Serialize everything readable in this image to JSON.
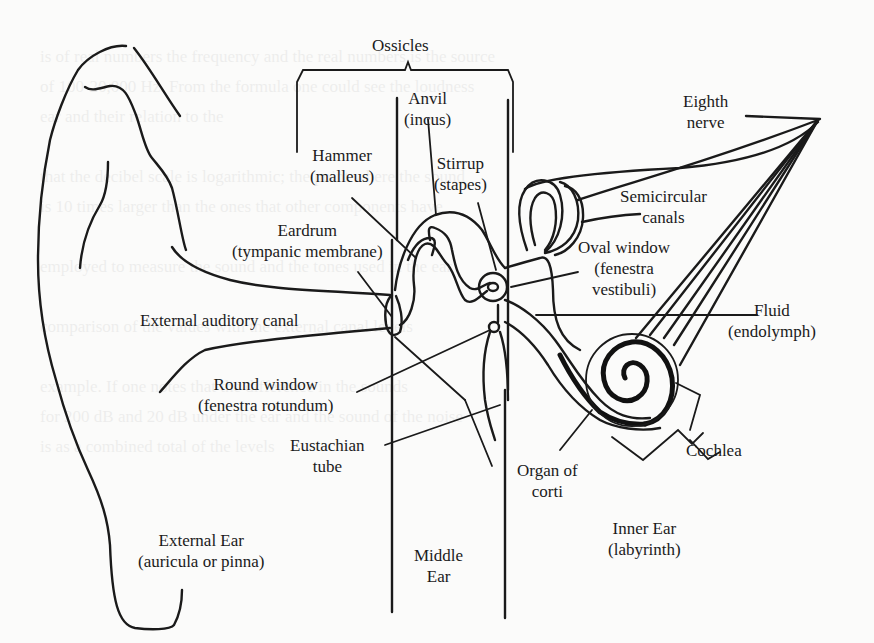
{
  "diagram": {
    "labels": {
      "ossicles": "Ossicles",
      "anvil": [
        "Anvil",
        "(incus)"
      ],
      "hammer": [
        "Hammer",
        "(malleus)"
      ],
      "stirrup": [
        "Stirrup",
        "(stapes)"
      ],
      "eighth_nerve": [
        "Eighth",
        "nerve"
      ],
      "semicircular_canals": [
        "Semicircular",
        "canals"
      ],
      "eardrum": [
        "Eardrum",
        "(tympanic membrane)"
      ],
      "oval_window": [
        "Oval window",
        "(fenestra",
        "vestibuli)"
      ],
      "fluid": [
        "Fluid",
        "(endolymph)"
      ],
      "external_auditory_canal": "External auditory canal",
      "round_window": [
        "Round window",
        "(fenestra rotundum)"
      ],
      "cochlea": "Cochlea",
      "eustachian_tube": [
        "Eustachian",
        "tube"
      ],
      "organ_of_corti": [
        "Organ of",
        "corti"
      ],
      "inner_ear": [
        "Inner Ear",
        "(labyrinth)"
      ],
      "external_ear": [
        "External Ear",
        "(auricula or pinna)"
      ],
      "middle_ear": [
        "Middle",
        "Ear"
      ]
    },
    "sections": [
      "External Ear",
      "Middle Ear",
      "Inner Ear"
    ],
    "colors": {
      "ink": "#1a1a1a",
      "paper": "#fbfbfa"
    }
  }
}
